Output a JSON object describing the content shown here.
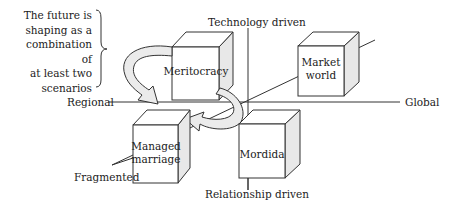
{
  "diagram": {
    "axes": {
      "top": "Technology driven",
      "bottom": "Relationship driven",
      "left": "Regional",
      "right": "Global",
      "diagonal_end": "Fragmented"
    },
    "note": {
      "line1": "The future is",
      "line2": "shaping as a",
      "line3": "combination of",
      "line4": "at least two",
      "line5": "scenarios"
    },
    "scenarios": [
      {
        "line1": "Meritocracy",
        "line2": ""
      },
      {
        "line1": "Market",
        "line2": "world"
      },
      {
        "line1": "Managed",
        "line2": "marriage"
      },
      {
        "line1": "Mordida",
        "line2": ""
      }
    ],
    "colors": {
      "line": "#333333",
      "cube_side": "#e8e8e8",
      "arrow_fill": "#ebebeb"
    }
  }
}
